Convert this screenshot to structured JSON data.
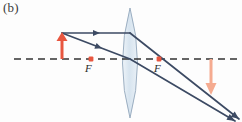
{
  "figure": {
    "panel_label": "(b)",
    "width": 242,
    "height": 122,
    "background_color": "#fdfdfd"
  },
  "labels": {
    "focal_left": "F",
    "focal_right": "F"
  },
  "colors": {
    "ray_stroke": "#3c4a63",
    "axis_dash": "#333333",
    "object_arrow": "#e8563f",
    "image_arrow": "#f5ab90",
    "focal_point": "#e8563f",
    "lens_fill": "#dce7f0",
    "lens_stroke": "#8fa3b8"
  },
  "optical_axis": {
    "name": "principal-axis",
    "y": 59,
    "x_start": 14,
    "x_end": 238,
    "style": "dashed"
  },
  "lens": {
    "name": "converging-lens",
    "center_x": 130,
    "top_y": 8,
    "bottom_y": 118,
    "half_width": 13,
    "type": "biconvex"
  },
  "focal_points": [
    {
      "name": "focal-point-left",
      "x": 91,
      "y": 59,
      "label": "F"
    },
    {
      "name": "focal-point-right",
      "x": 159,
      "y": 59,
      "label": "F"
    }
  ],
  "object": {
    "name": "object-arrow",
    "base_x": 62,
    "base_y": 59,
    "tip_x": 62,
    "tip_y": 33,
    "direction": "up"
  },
  "image": {
    "name": "image-arrow",
    "base_x": 211,
    "base_y": 59,
    "tip_x": 211,
    "tip_y": 93,
    "direction": "down"
  },
  "rays": [
    {
      "name": "parallel-ray",
      "segments": [
        {
          "x1": 62,
          "y1": 33,
          "x2": 130,
          "y2": 33
        },
        {
          "x1": 130,
          "y1": 33,
          "x2": 238,
          "y2": 118
        }
      ],
      "arrowheads": [
        {
          "x": 96,
          "y": 33,
          "angle": 0
        },
        {
          "x": 236,
          "y": 116,
          "angle": 38
        }
      ]
    },
    {
      "name": "center-ray",
      "segments": [
        {
          "x1": 62,
          "y1": 33,
          "x2": 130,
          "y2": 59
        },
        {
          "x1": 130,
          "y1": 59,
          "x2": 234,
          "y2": 120
        }
      ],
      "arrowheads": [
        {
          "x": 98,
          "y": 47,
          "angle": 21
        },
        {
          "x": 232,
          "y": 118,
          "angle": 30
        }
      ]
    }
  ]
}
